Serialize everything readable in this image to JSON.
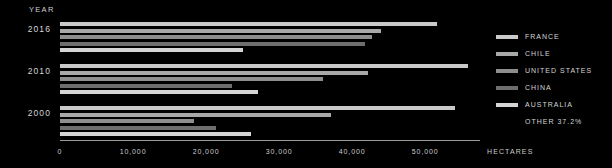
{
  "axis_heading": "YEAR",
  "axis_title": "HECTARES",
  "legend": {
    "entries": [
      {
        "label": "FRANCE",
        "color": "#c9c9c9"
      },
      {
        "label": "CHILE",
        "color": "#a8a8a8"
      },
      {
        "label": "UNITED STATES",
        "color": "#8e8e8e"
      },
      {
        "label": "CHINA",
        "color": "#6e6e6e"
      },
      {
        "label": "AUSTRALIA",
        "color": "#d5d5d5"
      }
    ],
    "other_label": "OTHER 37.2%"
  },
  "chart_data": {
    "type": "bar",
    "orientation": "horizontal",
    "title": "",
    "xlabel": "HECTARES",
    "ylabel": "YEAR",
    "categories": [
      "2016",
      "2010",
      "2000"
    ],
    "xlim": [
      0,
      57500
    ],
    "xticks": [
      0,
      10000,
      20000,
      30000,
      40000,
      50000
    ],
    "xtick_labels": [
      "0",
      "10,000",
      "20,000",
      "30,000",
      "40,000",
      "50,000"
    ],
    "grid": false,
    "legend_position": "right",
    "series": [
      {
        "name": "FRANCE",
        "color": "#c9c9c9",
        "values": [
          51600,
          55900,
          54100
        ]
      },
      {
        "name": "CHILE",
        "color": "#a8a8a8",
        "values": [
          44000,
          42200,
          37100
        ]
      },
      {
        "name": "UNITED STATES",
        "color": "#8e8e8e",
        "values": [
          42700,
          36000,
          18400
        ]
      },
      {
        "name": "CHINA",
        "color": "#6e6e6e",
        "values": [
          41800,
          23600,
          21400
        ]
      },
      {
        "name": "AUSTRALIA",
        "color": "#d5d5d5",
        "values": [
          25000,
          27100,
          26200
        ]
      }
    ]
  }
}
